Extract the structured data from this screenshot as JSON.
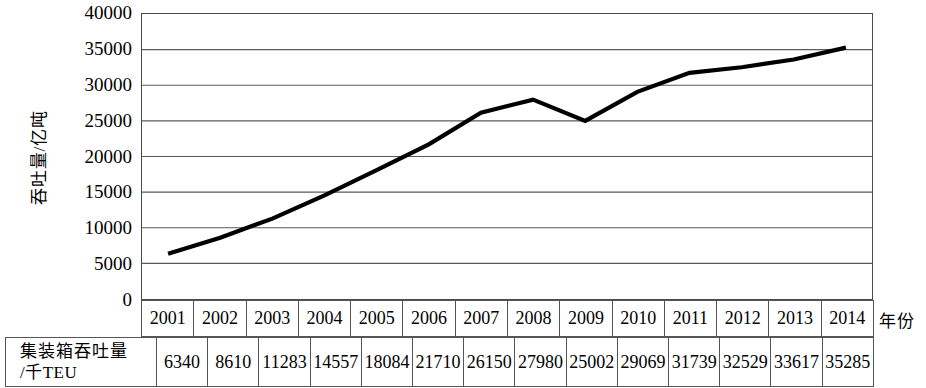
{
  "chart_data": {
    "type": "line",
    "title": "",
    "xlabel": "年份",
    "ylabel": "吞吐量/亿吨",
    "ylim": [
      0,
      40000
    ],
    "ytick_labels": [
      "40000",
      "35000",
      "30000",
      "25000",
      "20000",
      "15000",
      "10000",
      "5000",
      "0"
    ],
    "yticks": [
      40000,
      35000,
      30000,
      25000,
      20000,
      15000,
      10000,
      5000,
      0
    ],
    "grid": true,
    "legend": "none",
    "categories": [
      "2001",
      "2002",
      "2003",
      "2004",
      "2005",
      "2006",
      "2007",
      "2008",
      "2009",
      "2010",
      "2011",
      "2012",
      "2013",
      "2014"
    ],
    "values": [
      6340,
      8610,
      11283,
      14557,
      18084,
      21710,
      26150,
      27980,
      25002,
      29069,
      31739,
      32529,
      33617,
      35285
    ],
    "series": [
      {
        "name": "吞吐量/亿吨",
        "values": [
          6340,
          8610,
          11283,
          14557,
          18084,
          21710,
          26150,
          27980,
          25002,
          29069,
          31739,
          32529,
          33617,
          35285
        ],
        "color": "#000000"
      }
    ]
  },
  "axes": {
    "y_title": "吞吐量/亿吨",
    "x_title": "年份"
  },
  "table": {
    "row_label_line1": "集装箱吞吐量",
    "row_label_line2": "/千TEU",
    "years": [
      "2001",
      "2002",
      "2003",
      "2004",
      "2005",
      "2006",
      "2007",
      "2008",
      "2009",
      "2010",
      "2011",
      "2012",
      "2013",
      "2014"
    ],
    "values": [
      "6340",
      "8610",
      "11283",
      "14557",
      "18084",
      "21710",
      "26150",
      "27980",
      "25002",
      "29069",
      "31739",
      "32529",
      "33617",
      "35285"
    ]
  },
  "style": {
    "line_color": "#000000",
    "grid_color": "#5a5a5a",
    "border_color": "#4a4a4a",
    "background": "#ffffff"
  }
}
